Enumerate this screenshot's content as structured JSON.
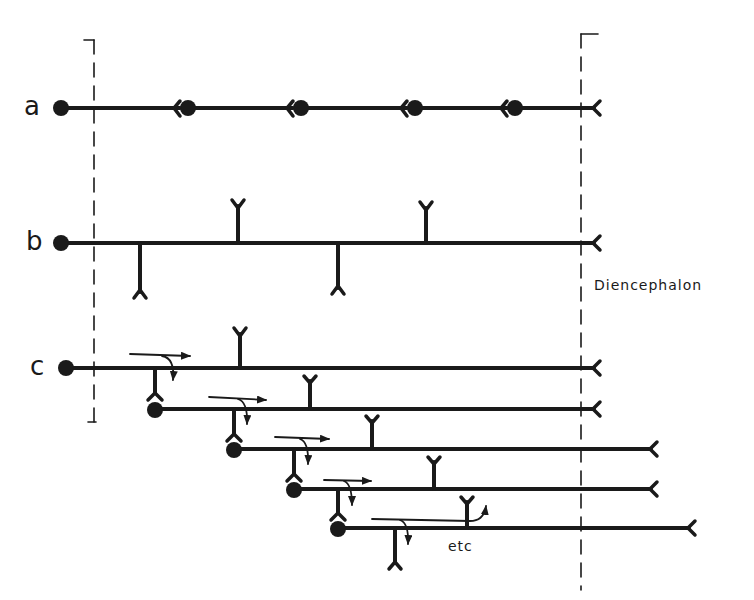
{
  "diagram": {
    "colors": {
      "ink": "#1a1a1a",
      "background": "#ffffff"
    },
    "labels": {
      "row_a": "a",
      "row_b": "b",
      "row_c": "c",
      "region": "Diencephalon",
      "continuation": "etc"
    },
    "rows": [
      {
        "id": "a",
        "description": "chain of neurons: soma with axon terminating on next soma",
        "y": 108,
        "somata_x": [
          60,
          188,
          301,
          415,
          515
        ],
        "terminal_x": 598
      },
      {
        "id": "b",
        "description": "single long axon with collateral branches",
        "y": 243,
        "soma_x": 60,
        "terminal_x": 598,
        "collaterals_up_x": [
          238,
          426
        ],
        "collaterals_down_x": [
          140,
          338
        ]
      },
      {
        "id": "c",
        "description": "cascade of neurons with collaterals and arrows indicating signal flow",
        "lines": [
          {
            "y": 368,
            "soma_x": 66,
            "end_x": 598
          },
          {
            "y": 409,
            "soma_x": 155,
            "end_x": 598
          },
          {
            "y": 449,
            "soma_x": 234,
            "end_x": 655
          },
          {
            "y": 489,
            "soma_x": 294,
            "end_x": 655
          },
          {
            "y": 528,
            "soma_x": 338,
            "end_x": 693
          }
        ]
      }
    ],
    "boundaries": [
      {
        "name": "left-boundary",
        "x": 94
      },
      {
        "name": "diencephalon-boundary",
        "x": 581
      }
    ]
  }
}
